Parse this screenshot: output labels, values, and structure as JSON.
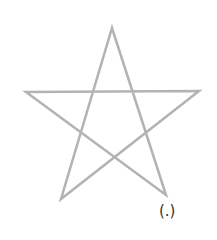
{
  "diagram": {
    "shape": "pentagram",
    "stroke_color": "#b3b3b3",
    "stroke_width": 2.5,
    "points": [
      {
        "name": "top",
        "x": 112,
        "y": 28
      },
      {
        "name": "bottom-right",
        "x": 166,
        "y": 195
      },
      {
        "name": "left",
        "x": 26,
        "y": 92
      },
      {
        "name": "right",
        "x": 199,
        "y": 91
      },
      {
        "name": "bottom-left",
        "x": 61,
        "y": 199
      }
    ],
    "label": "(.)"
  }
}
